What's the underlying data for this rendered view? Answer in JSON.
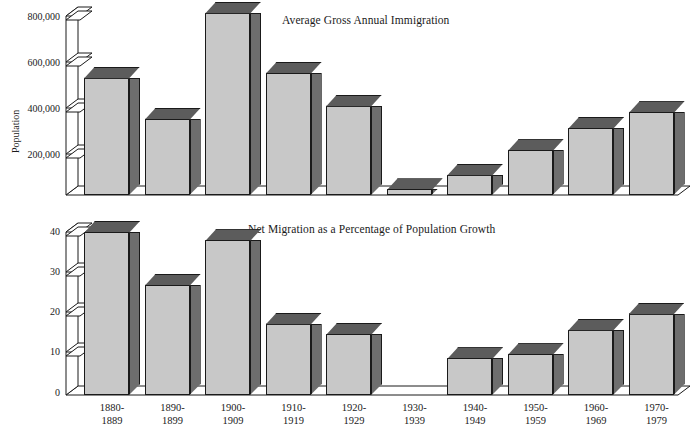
{
  "figure": {
    "background": "#ffffff",
    "bar_face_color": "#c8c8c8",
    "bar_side_color": "#6e6e6e",
    "bar_top_color": "#5c5c5c",
    "line_color": "#1a1a1a"
  },
  "categories": [
    "1880-1889",
    "1890-1899",
    "1900-1909",
    "1910-1919",
    "1920-1929",
    "1930-1939",
    "1940-1949",
    "1950-1959",
    "1960-1969",
    "1970-1979"
  ],
  "category_lines": [
    {
      "a": "1880-",
      "b": "1889"
    },
    {
      "a": "1890-",
      "b": "1899"
    },
    {
      "a": "1900-",
      "b": "1909"
    },
    {
      "a": "1910-",
      "b": "1919"
    },
    {
      "a": "1920-",
      "b": "1929"
    },
    {
      "a": "1930-",
      "b": "1939"
    },
    {
      "a": "1940-",
      "b": "1949"
    },
    {
      "a": "1950-",
      "b": "1959"
    },
    {
      "a": "1960-",
      "b": "1969"
    },
    {
      "a": "1970-",
      "b": "1979"
    }
  ],
  "chart_data": [
    {
      "type": "bar",
      "title": "Average Gross Annual Immigration",
      "xlabel": "",
      "ylabel": "Population",
      "ylim": [
        0,
        880000
      ],
      "yticks": [
        200000,
        400000,
        600000,
        800000
      ],
      "ytick_labels": [
        "200,000",
        "400,000",
        "600,000",
        "800,000"
      ],
      "grid": false,
      "legend": "none",
      "categories": [
        "1880-1889",
        "1890-1899",
        "1900-1909",
        "1910-1919",
        "1920-1929",
        "1930-1939",
        "1940-1949",
        "1950-1959",
        "1960-1969",
        "1970-1979"
      ],
      "values": [
        525000,
        340000,
        815000,
        545000,
        400000,
        25000,
        90000,
        200000,
        300000,
        370000
      ]
    },
    {
      "type": "bar",
      "title": "Net Migration as a Percentage of Population Growth",
      "xlabel": "",
      "ylabel": "Percent",
      "ylim": [
        0,
        42
      ],
      "yticks": [
        0,
        10,
        20,
        30,
        40
      ],
      "ytick_labels": [
        "0",
        "10",
        "20",
        "30",
        "40"
      ],
      "grid": false,
      "legend": "none",
      "categories": [
        "1880-1889",
        "1890-1899",
        "1900-1909",
        "1910-1919",
        "1920-1929",
        "1930-1939",
        "1940-1949",
        "1950-1959",
        "1960-1969",
        "1970-1979"
      ],
      "values": [
        40,
        27,
        38,
        17.5,
        15,
        0,
        9,
        10,
        16,
        20
      ]
    }
  ]
}
